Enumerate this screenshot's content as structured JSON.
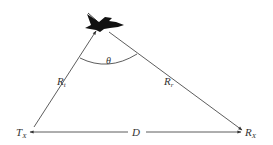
{
  "diagram": {
    "nodes": {
      "transmitter": {
        "label": "T",
        "sub": "X"
      },
      "receiver": {
        "label": "R",
        "sub": "X"
      },
      "target": {
        "label": "aircraft",
        "icon": "aircraft-icon"
      }
    },
    "edges": {
      "tx_to_target": {
        "label": "R",
        "sub": "t"
      },
      "target_to_rx": {
        "label": "R",
        "sub": "r"
      },
      "baseline": {
        "label": "D"
      }
    },
    "angle": {
      "label": "θ"
    },
    "colors": {
      "line": "#333333",
      "background": "#ffffff",
      "aircraft": "#111111"
    }
  }
}
